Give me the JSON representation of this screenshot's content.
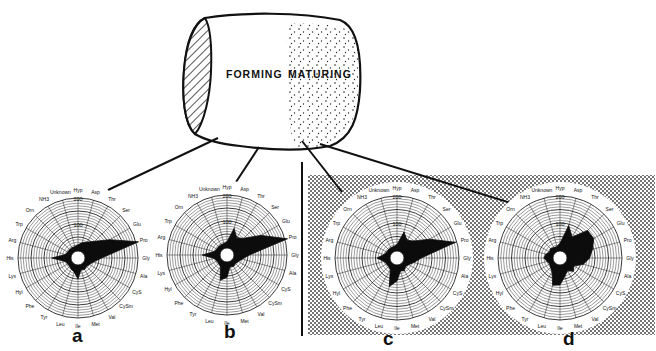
{
  "diagram": {
    "tooth": {
      "zones": [
        {
          "label": "FORMING",
          "pattern": "plain"
        },
        {
          "label": "MATURING",
          "pattern": "stippled"
        }
      ],
      "end_cap_pattern": "hatched"
    },
    "panels": [
      {
        "id": "a",
        "label": "a",
        "background": "plain",
        "zone": "forming"
      },
      {
        "id": "b",
        "label": "b",
        "background": "plain",
        "zone": "forming"
      },
      {
        "id": "c",
        "label": "c",
        "background": "stippled",
        "zone": "maturing"
      },
      {
        "id": "d",
        "label": "d",
        "background": "stippled",
        "zone": "maturing"
      }
    ],
    "radial_axis": {
      "labels": [
        "Hyp",
        "Asp",
        "Thr",
        "Ser",
        "Glu",
        "Pro",
        "Gly",
        "Ala",
        "CyS",
        "CySm",
        "Val",
        "Met",
        "Ile",
        "Leu",
        "Tyr",
        "Phe",
        "Hyl",
        "Lys",
        "His",
        "Arg",
        "Trp",
        "Orn",
        "NH3",
        "Unknown"
      ],
      "scale_ticks": [
        "100",
        "200"
      ],
      "max": 200
    },
    "colors": {
      "ink": "#111111",
      "paper": "#ffffff",
      "stipple": "#8a8a8a"
    }
  },
  "chart_data": [
    {
      "type": "radar",
      "title": "a",
      "categories": [
        "Hyp",
        "Asp",
        "Thr",
        "Ser",
        "Glu",
        "Pro",
        "Gly",
        "Ala",
        "CyS",
        "CySm",
        "Val",
        "Met",
        "Ile",
        "Leu",
        "Tyr",
        "Phe",
        "Hyl",
        "Lys",
        "His",
        "Arg",
        "Trp",
        "Orn",
        "NH3",
        "Unknown"
      ],
      "values": [
        20,
        30,
        40,
        60,
        110,
        210,
        60,
        30,
        20,
        15,
        20,
        15,
        50,
        25,
        20,
        15,
        15,
        20,
        70,
        20,
        15,
        15,
        15,
        15
      ],
      "rlim": [
        0,
        200
      ],
      "rticks": [
        100,
        200
      ]
    },
    {
      "type": "radar",
      "title": "b",
      "categories": [
        "Hyp",
        "Asp",
        "Thr",
        "Ser",
        "Glu",
        "Pro",
        "Gly",
        "Ala",
        "CyS",
        "CySm",
        "Val",
        "Met",
        "Ile",
        "Leu",
        "Tyr",
        "Phe",
        "Hyl",
        "Lys",
        "His",
        "Arg",
        "Trp",
        "Orn",
        "NH3",
        "Unknown"
      ],
      "values": [
        20,
        75,
        45,
        60,
        120,
        210,
        55,
        30,
        20,
        15,
        20,
        15,
        55,
        70,
        20,
        15,
        15,
        20,
        65,
        20,
        15,
        15,
        15,
        15
      ],
      "rlim": [
        0,
        200
      ],
      "rticks": [
        100,
        200
      ]
    },
    {
      "type": "radar",
      "title": "c",
      "categories": [
        "Hyp",
        "Asp",
        "Thr",
        "Ser",
        "Glu",
        "Pro",
        "Gly",
        "Ala",
        "CyS",
        "CySm",
        "Val",
        "Met",
        "Ile",
        "Leu",
        "Tyr",
        "Phe",
        "Hyl",
        "Lys",
        "His",
        "Arg",
        "Trp",
        "Orn",
        "NH3",
        "Unknown"
      ],
      "values": [
        20,
        70,
        45,
        60,
        110,
        195,
        60,
        35,
        20,
        15,
        25,
        20,
        55,
        80,
        20,
        15,
        15,
        20,
        45,
        20,
        15,
        15,
        15,
        15
      ],
      "rlim": [
        0,
        200
      ],
      "rticks": [
        100,
        200
      ]
    },
    {
      "type": "radar",
      "title": "d",
      "categories": [
        "Hyp",
        "Asp",
        "Thr",
        "Ser",
        "Glu",
        "Pro",
        "Gly",
        "Ala",
        "CyS",
        "CySm",
        "Val",
        "Met",
        "Ile",
        "Leu",
        "Tyr",
        "Phe",
        "Hyl",
        "Lys",
        "His",
        "Arg",
        "Trp",
        "Orn",
        "NH3",
        "Unknown"
      ],
      "values": [
        25,
        95,
        60,
        115,
        115,
        95,
        80,
        60,
        30,
        40,
        25,
        40,
        70,
        75,
        30,
        20,
        15,
        20,
        30,
        25,
        15,
        20,
        15,
        15
      ],
      "rlim": [
        0,
        200
      ],
      "rticks": [
        100,
        200
      ]
    }
  ]
}
